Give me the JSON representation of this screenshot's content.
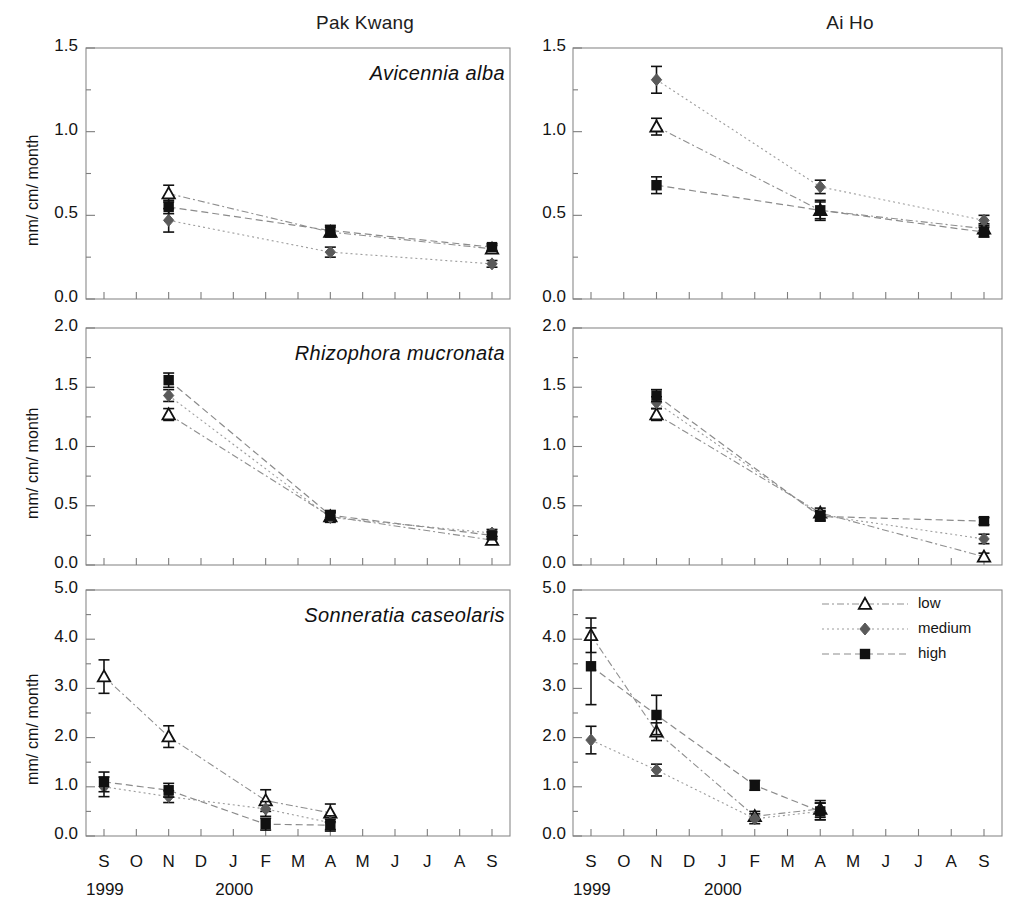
{
  "figure": {
    "width": 1013,
    "height": 912,
    "columns": [
      {
        "key": "pak_kwang",
        "title": "Pak Kwang"
      },
      {
        "key": "ai_ho",
        "title": "Ai Ho"
      }
    ],
    "axis_label": "mm/ cm/ month",
    "x_tick_labels": [
      "S",
      "O",
      "N",
      "D",
      "J",
      "F",
      "M",
      "A",
      "M",
      "J",
      "J",
      "A",
      "S"
    ],
    "year_labels": [
      {
        "text": "1999",
        "at_month": "S"
      },
      {
        "text": "2000",
        "at_month": "J"
      }
    ],
    "colors": {
      "low": "#ffffff",
      "low_stroke": "#111111",
      "medium": "#5a5a5a",
      "high": "#111111",
      "frame": "#8a8a8a",
      "line": "#9a9a9a",
      "text": "#141414"
    }
  },
  "legend": {
    "position": "top-right of bottom-right panel",
    "entries": [
      {
        "label": "low",
        "marker": "open-triangle",
        "line": "dash-dot"
      },
      {
        "label": "medium",
        "marker": "gray-diamond",
        "line": "dotted"
      },
      {
        "label": "high",
        "marker": "black-square",
        "line": "dashed"
      }
    ]
  },
  "chart_data": [
    {
      "id": "avicennia-pak-kwang",
      "type": "line",
      "title": "Avicennia alba",
      "panel": "Pak Kwang",
      "xlabel": "",
      "ylabel": "mm/ cm/ month",
      "x": [
        "S",
        "O",
        "N",
        "D",
        "J",
        "F",
        "M",
        "A",
        "M",
        "J",
        "J",
        "A",
        "S"
      ],
      "ylim": [
        0.0,
        1.5
      ],
      "yticks": [
        0.0,
        0.5,
        1.0,
        1.5
      ],
      "ytick_labels": [
        "0.0",
        "0.5",
        "1.0",
        "1.5"
      ],
      "minor_ytick_step": 0.25,
      "grid": false,
      "series": [
        {
          "name": "low",
          "points": [
            {
              "x": "N",
              "y": 0.63,
              "err": 0.05
            },
            {
              "x": "A",
              "y": 0.4,
              "err": 0.03
            },
            {
              "x": "S",
              "y": 0.3,
              "err": 0.02
            }
          ]
        },
        {
          "name": "medium",
          "points": [
            {
              "x": "N",
              "y": 0.47,
              "err": 0.07
            },
            {
              "x": "A",
              "y": 0.28,
              "err": 0.03
            },
            {
              "x": "S",
              "y": 0.21,
              "err": 0.02
            }
          ]
        },
        {
          "name": "high",
          "points": [
            {
              "x": "N",
              "y": 0.55,
              "err": 0.04
            },
            {
              "x": "A",
              "y": 0.41,
              "err": 0.03
            },
            {
              "x": "S",
              "y": 0.31,
              "err": 0.02
            }
          ]
        }
      ]
    },
    {
      "id": "avicennia-ai-ho",
      "type": "line",
      "title": "",
      "panel": "Ai Ho",
      "xlabel": "",
      "ylabel": "",
      "x": [
        "S",
        "O",
        "N",
        "D",
        "J",
        "F",
        "M",
        "A",
        "M",
        "J",
        "J",
        "A",
        "S"
      ],
      "ylim": [
        0.0,
        1.5
      ],
      "yticks": [
        0.0,
        0.5,
        1.0,
        1.5
      ],
      "ytick_labels": [
        "0.0",
        "0.5",
        "1.0",
        "1.5"
      ],
      "minor_ytick_step": 0.25,
      "grid": false,
      "series": [
        {
          "name": "low",
          "points": [
            {
              "x": "N",
              "y": 1.03,
              "err": 0.05
            },
            {
              "x": "A",
              "y": 0.53,
              "err": 0.05
            },
            {
              "x": "S",
              "y": 0.42,
              "err": 0.03
            }
          ]
        },
        {
          "name": "medium",
          "points": [
            {
              "x": "N",
              "y": 1.31,
              "err": 0.08
            },
            {
              "x": "A",
              "y": 0.67,
              "err": 0.04
            },
            {
              "x": "S",
              "y": 0.47,
              "err": 0.03
            }
          ]
        },
        {
          "name": "high",
          "points": [
            {
              "x": "N",
              "y": 0.68,
              "err": 0.05
            },
            {
              "x": "A",
              "y": 0.53,
              "err": 0.06
            },
            {
              "x": "S",
              "y": 0.4,
              "err": 0.03
            }
          ]
        }
      ]
    },
    {
      "id": "rhizophora-pak-kwang",
      "type": "line",
      "title": "Rhizophora mucronata",
      "panel": "Pak Kwang",
      "xlabel": "",
      "ylabel": "mm/ cm/ month",
      "x": [
        "S",
        "O",
        "N",
        "D",
        "J",
        "F",
        "M",
        "A",
        "M",
        "J",
        "J",
        "A",
        "S"
      ],
      "ylim": [
        0.0,
        2.0
      ],
      "yticks": [
        0.0,
        0.5,
        1.0,
        1.5,
        2.0
      ],
      "ytick_labels": [
        "0.0",
        "0.5",
        "1.0",
        "1.5",
        "2.0"
      ],
      "minor_ytick_step": 0.25,
      "grid": false,
      "series": [
        {
          "name": "low",
          "points": [
            {
              "x": "N",
              "y": 1.27,
              "err": 0.05
            },
            {
              "x": "A",
              "y": 0.41,
              "err": 0.04
            },
            {
              "x": "S",
              "y": 0.21,
              "err": 0.03
            }
          ]
        },
        {
          "name": "medium",
          "points": [
            {
              "x": "N",
              "y": 1.43,
              "err": 0.05
            },
            {
              "x": "A",
              "y": 0.4,
              "err": 0.04
            },
            {
              "x": "S",
              "y": 0.27,
              "err": 0.03
            }
          ]
        },
        {
          "name": "high",
          "points": [
            {
              "x": "N",
              "y": 1.56,
              "err": 0.06
            },
            {
              "x": "A",
              "y": 0.42,
              "err": 0.04
            },
            {
              "x": "S",
              "y": 0.25,
              "err": 0.03
            }
          ]
        }
      ]
    },
    {
      "id": "rhizophora-ai-ho",
      "type": "line",
      "title": "",
      "panel": "Ai Ho",
      "xlabel": "",
      "ylabel": "",
      "x": [
        "S",
        "O",
        "N",
        "D",
        "J",
        "F",
        "M",
        "A",
        "M",
        "J",
        "J",
        "A",
        "S"
      ],
      "ylim": [
        0.0,
        2.0
      ],
      "yticks": [
        0.0,
        0.5,
        1.0,
        1.5,
        2.0
      ],
      "ytick_labels": [
        "0.0",
        "0.5",
        "1.0",
        "1.5",
        "2.0"
      ],
      "minor_ytick_step": 0.25,
      "grid": false,
      "series": [
        {
          "name": "low",
          "points": [
            {
              "x": "N",
              "y": 1.27,
              "err": 0.05
            },
            {
              "x": "A",
              "y": 0.44,
              "err": 0.04
            },
            {
              "x": "S",
              "y": 0.07,
              "err": 0.03
            }
          ]
        },
        {
          "name": "medium",
          "points": [
            {
              "x": "N",
              "y": 1.37,
              "err": 0.05
            },
            {
              "x": "A",
              "y": 0.42,
              "err": 0.04
            },
            {
              "x": "S",
              "y": 0.22,
              "err": 0.04
            }
          ]
        },
        {
          "name": "high",
          "points": [
            {
              "x": "N",
              "y": 1.43,
              "err": 0.05
            },
            {
              "x": "A",
              "y": 0.41,
              "err": 0.04
            },
            {
              "x": "S",
              "y": 0.37,
              "err": 0.03
            }
          ]
        }
      ]
    },
    {
      "id": "sonneratia-pak-kwang",
      "type": "line",
      "title": "Sonneratia caseolaris",
      "panel": "Pak Kwang",
      "xlabel": "",
      "ylabel": "mm/ cm/ month",
      "x": [
        "S",
        "O",
        "N",
        "D",
        "J",
        "F",
        "M",
        "A",
        "M",
        "J",
        "J",
        "A",
        "S"
      ],
      "ylim": [
        0.0,
        5.0
      ],
      "yticks": [
        0.0,
        1.0,
        2.0,
        3.0,
        4.0,
        5.0
      ],
      "ytick_labels": [
        "0.0",
        "1.0",
        "2.0",
        "3.0",
        "4.0",
        "5.0"
      ],
      "minor_ytick_step": 0.5,
      "grid": false,
      "series": [
        {
          "name": "low",
          "points": [
            {
              "x": "S",
              "y": 3.24,
              "err": 0.34
            },
            {
              "x": "N",
              "y": 2.02,
              "err": 0.22
            },
            {
              "x": "F",
              "y": 0.72,
              "err": 0.22
            },
            {
              "x": "A",
              "y": 0.47,
              "err": 0.18
            }
          ]
        },
        {
          "name": "medium",
          "points": [
            {
              "x": "S",
              "y": 1.0,
              "err": 0.2
            },
            {
              "x": "N",
              "y": 0.8,
              "err": 0.12
            },
            {
              "x": "F",
              "y": 0.55,
              "err": 0.15
            },
            {
              "x": "A",
              "y": 0.27,
              "err": 0.14
            }
          ]
        },
        {
          "name": "high",
          "points": [
            {
              "x": "S",
              "y": 1.1,
              "err": 0.2
            },
            {
              "x": "N",
              "y": 0.93,
              "err": 0.14
            },
            {
              "x": "F",
              "y": 0.24,
              "err": 0.12
            },
            {
              "x": "A",
              "y": 0.22,
              "err": 0.12
            }
          ]
        }
      ]
    },
    {
      "id": "sonneratia-ai-ho",
      "type": "line",
      "title": "",
      "panel": "Ai Ho",
      "xlabel": "",
      "ylabel": "",
      "x": [
        "S",
        "O",
        "N",
        "D",
        "J",
        "F",
        "M",
        "A",
        "M",
        "J",
        "J",
        "A",
        "S"
      ],
      "ylim": [
        0.0,
        5.0
      ],
      "yticks": [
        0.0,
        1.0,
        2.0,
        3.0,
        4.0,
        5.0
      ],
      "ytick_labels": [
        "0.0",
        "1.0",
        "2.0",
        "3.0",
        "4.0",
        "5.0"
      ],
      "minor_ytick_step": 0.5,
      "grid": false,
      "series": [
        {
          "name": "low",
          "points": [
            {
              "x": "S",
              "y": 4.08,
              "err": 0.35
            },
            {
              "x": "N",
              "y": 2.12,
              "err": 0.18
            },
            {
              "x": "F",
              "y": 0.4,
              "err": 0.1
            },
            {
              "x": "A",
              "y": 0.55,
              "err": 0.17
            }
          ]
        },
        {
          "name": "medium",
          "points": [
            {
              "x": "S",
              "y": 1.95,
              "err": 0.28
            },
            {
              "x": "N",
              "y": 1.34,
              "err": 0.12
            },
            {
              "x": "F",
              "y": 0.35,
              "err": 0.1
            },
            {
              "x": "A",
              "y": 0.5,
              "err": 0.17
            }
          ]
        },
        {
          "name": "high",
          "points": [
            {
              "x": "S",
              "y": 3.45,
              "err": 0.78
            },
            {
              "x": "N",
              "y": 2.46,
              "err": 0.4
            },
            {
              "x": "F",
              "y": 1.03,
              "err": 0.1
            },
            {
              "x": "A",
              "y": 0.5,
              "err": 0.17
            }
          ]
        }
      ]
    }
  ]
}
